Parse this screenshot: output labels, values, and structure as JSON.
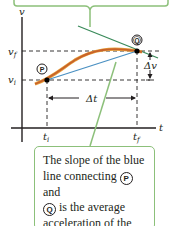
{
  "axes": {
    "y_label": "v",
    "x_label": "t",
    "y_ticks": [
      {
        "label_main": "v",
        "label_sub": "f",
        "name": "v-final"
      },
      {
        "label_main": "v",
        "label_sub": "i",
        "name": "v-initial"
      }
    ],
    "x_ticks": [
      {
        "label_main": "t",
        "label_sub": "i",
        "name": "t-initial"
      },
      {
        "label_main": "t",
        "label_sub": "f",
        "name": "t-final"
      }
    ]
  },
  "points": {
    "p": {
      "label": "P"
    },
    "q": {
      "label": "Q"
    }
  },
  "intervals": {
    "delta_t": "Δt",
    "delta_v": "Δv"
  },
  "colors": {
    "curve": "#c8622a",
    "curve_highlight": "#e8a23c",
    "secant": "#4a90c2",
    "tangent": "#3a8a5a",
    "callout_border": "#8cc07a",
    "axis": "#231f20"
  },
  "caption": {
    "line1": "The slope of the blue",
    "line2_before": "line connecting ",
    "line2_after": " and",
    "line3_after": " is the average",
    "line4": "acceleration of the car",
    "line5": "during the time interval"
  }
}
